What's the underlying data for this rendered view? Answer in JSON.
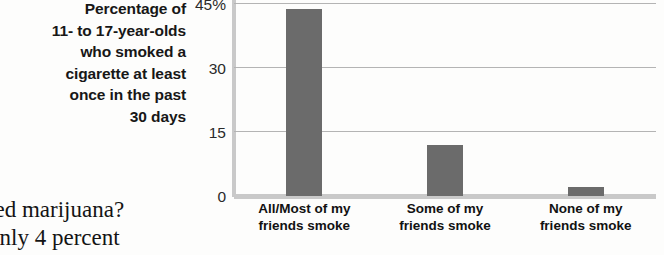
{
  "caption": {
    "lines": [
      "Percentage of",
      "11- to 17-year-olds",
      "who smoked a",
      "cigarette at least",
      "once in the past",
      "30 days"
    ]
  },
  "body_text": {
    "lines": [
      "ked marijuana?",
      "Only 4 percent"
    ]
  },
  "colors": {
    "bar": "#6b6b6b",
    "gridline": "#b4b4b4",
    "axis": "#c9c9c9",
    "text": "#141414",
    "background": "#fdfdfc"
  },
  "chart_data": {
    "type": "bar",
    "title": "",
    "xlabel": "",
    "ylabel": "Percentage of 11- to 17-year-olds who smoked a cigarette at least once in the past 30 days",
    "categories": [
      "All/Most of my friends smoke",
      "Some of my friends smoke",
      "None of my friends smoke"
    ],
    "category_lines": [
      [
        "All/Most of my",
        "friends smoke"
      ],
      [
        "Some of my",
        "friends smoke"
      ],
      [
        "None of my",
        "friends smoke"
      ]
    ],
    "values": [
      44,
      12,
      2
    ],
    "ylim": [
      0,
      46
    ],
    "yticks": [
      0,
      15,
      30,
      45
    ],
    "ytick_labels": [
      "0",
      "15",
      "30",
      "45%"
    ],
    "grid": true,
    "legend": "none",
    "orientation": "vertical"
  }
}
